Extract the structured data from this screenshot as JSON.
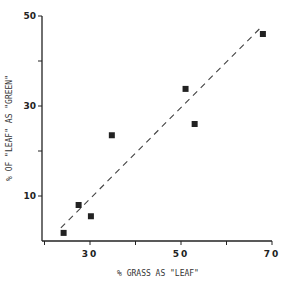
{
  "chart_data": {
    "type": "scatter",
    "title": "",
    "xlabel": "% GRASS AS \"LEAF\"",
    "ylabel": "% OF \"LEAF\" AS \"GREEN\"",
    "xlim": [
      20,
      70
    ],
    "ylim": [
      0,
      50
    ],
    "x_ticks": [
      20,
      30,
      40,
      50,
      60,
      70
    ],
    "x_tick_labels": [
      "",
      "30",
      "",
      "50",
      "",
      "70"
    ],
    "y_ticks": [
      10,
      20,
      30,
      40,
      50
    ],
    "y_tick_labels": [
      "10",
      "",
      "30",
      "",
      "50"
    ],
    "grid": false,
    "legend": null,
    "series": [
      {
        "name": "observations",
        "marker": "filled-square",
        "points": [
          {
            "x": 24.2,
            "y": 1.8
          },
          {
            "x": 27.5,
            "y": 8.0
          },
          {
            "x": 30.2,
            "y": 5.5
          },
          {
            "x": 34.8,
            "y": 23.5
          },
          {
            "x": 51.0,
            "y": 33.8
          },
          {
            "x": 53.0,
            "y": 26.0
          },
          {
            "x": 68.0,
            "y": 46.0
          }
        ]
      },
      {
        "name": "fitted-line",
        "style": "dashed",
        "points": [
          {
            "x": 23.6,
            "y": 2.9
          },
          {
            "x": 67.4,
            "y": 47.3
          }
        ]
      }
    ]
  },
  "colors": {
    "ink": "#222222",
    "background": "#ffffff"
  }
}
